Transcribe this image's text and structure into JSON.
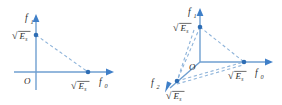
{
  "figure": {
    "background_color": "#ffffff",
    "axis_color": "#6f9fd0",
    "arrow_color": "#3f7fc8",
    "dash_color": "#8fb4da",
    "point_color": "#2e6db4",
    "text_color": "#2e2e2e",
    "panels": [
      {
        "id": "left",
        "name": "two-dimensional-constellation-energy-diagram",
        "dimensionality": "2D",
        "origin_label": "O",
        "axes": [
          {
            "name": "f0",
            "base_symbol": "f",
            "subscript": "0",
            "direction": "right",
            "tick_label": {
              "symbol": "√",
              "base": "E",
              "subscript": "s",
              "text": "√Eₛ"
            }
          },
          {
            "name": "f1",
            "base_symbol": "f",
            "subscript": "1",
            "direction": "up",
            "tick_label": {
              "symbol": "√",
              "base": "E",
              "subscript": "s",
              "text": "√Eₛ"
            }
          }
        ],
        "points": [
          {
            "name": "point-f0-axis",
            "axis": "f0",
            "value_text": "√Eₛ"
          },
          {
            "name": "point-f1-axis",
            "axis": "f1",
            "value_text": "√Eₛ"
          }
        ],
        "connectors": [
          {
            "name": "dashed-hypotenuse",
            "from": "point-f1-axis",
            "to": "point-f0-axis",
            "style": "dashed"
          }
        ]
      },
      {
        "id": "right",
        "name": "three-dimensional-constellation-energy-diagram",
        "dimensionality": "3D",
        "origin_label": "O",
        "axes": [
          {
            "name": "f0",
            "base_symbol": "f",
            "subscript": "0",
            "direction": "right",
            "tick_label": {
              "symbol": "√",
              "base": "E",
              "subscript": "s",
              "text": "√Eₛ"
            }
          },
          {
            "name": "f1",
            "base_symbol": "f",
            "subscript": "1",
            "direction": "up",
            "tick_label": {
              "symbol": "√",
              "base": "E",
              "subscript": "s",
              "text": "√Eₛ"
            }
          },
          {
            "name": "f2",
            "base_symbol": "f",
            "subscript": "2",
            "direction": "lower-left",
            "tick_label": {
              "symbol": "√",
              "base": "E",
              "subscript": "s",
              "text": "√Eₛ"
            }
          }
        ],
        "points": [
          {
            "name": "point-f0-axis",
            "axis": "f0",
            "value_text": "√Eₛ"
          },
          {
            "name": "point-f1-axis",
            "axis": "f1",
            "value_text": "√Eₛ"
          },
          {
            "name": "point-f2-axis",
            "axis": "f2",
            "value_text": "√Eₛ"
          }
        ],
        "connectors": [
          {
            "name": "dashed-edge-f1-f0",
            "from": "point-f1-axis",
            "to": "point-f0-axis",
            "style": "dashed"
          },
          {
            "name": "dashed-edge-f1-f2",
            "from": "point-f1-axis",
            "to": "point-f2-axis",
            "style": "dashed"
          },
          {
            "name": "dashed-edge-f2-f0",
            "from": "point-f2-axis",
            "to": "point-f0-axis",
            "style": "dashed"
          }
        ]
      }
    ],
    "labels": {
      "f_base": "f",
      "sub_0": "0",
      "sub_1": "1",
      "sub_2": "2",
      "origin": "O",
      "radical": "√",
      "energy_base": "E",
      "energy_sub": "s"
    }
  }
}
